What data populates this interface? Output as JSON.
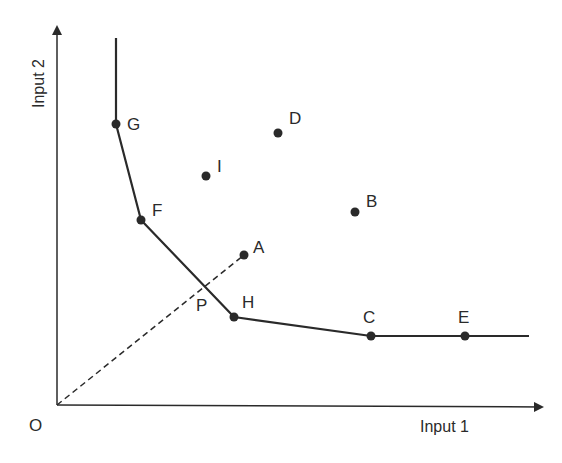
{
  "diagram": {
    "type": "isoquant",
    "axes": {
      "x_label": "Input 1",
      "y_label": "Input 2",
      "origin_label": "O"
    },
    "colors": {
      "ink": "#2a2a2a",
      "background": "#ffffff"
    },
    "frontier": {
      "description": "Piecewise-linear efficient isoquant through G, F, H, C, E",
      "points": [
        "G",
        "F",
        "H",
        "C",
        "E"
      ]
    },
    "points": [
      {
        "id": "G",
        "label": "G",
        "x": 116,
        "y": 124,
        "on_frontier": true
      },
      {
        "id": "F",
        "label": "F",
        "x": 141,
        "y": 220,
        "on_frontier": true
      },
      {
        "id": "H",
        "label": "H",
        "x": 234,
        "y": 317,
        "on_frontier": true
      },
      {
        "id": "C",
        "label": "C",
        "x": 371,
        "y": 336,
        "on_frontier": true
      },
      {
        "id": "E",
        "label": "E",
        "x": 465,
        "y": 336,
        "on_frontier": true
      },
      {
        "id": "I",
        "label": "I",
        "x": 206,
        "y": 176,
        "on_frontier": false
      },
      {
        "id": "D",
        "label": "D",
        "x": 278,
        "y": 133,
        "on_frontier": false
      },
      {
        "id": "B",
        "label": "B",
        "x": 355,
        "y": 212,
        "on_frontier": false
      },
      {
        "id": "A",
        "label": "A",
        "x": 244,
        "y": 255,
        "on_frontier": false
      }
    ],
    "projection": {
      "from": "O",
      "to": "A",
      "style": "dashed",
      "intersection_label": "P"
    }
  }
}
